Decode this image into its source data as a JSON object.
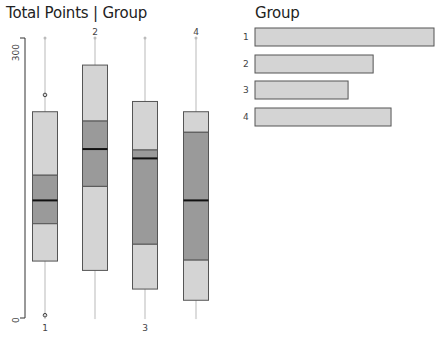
{
  "left_panel": {
    "title": "Total Points | Group"
  },
  "right_panel": {
    "title": "Group"
  },
  "colors": {
    "box_light": "#d4d4d4",
    "box_dark": "#9a9a9a",
    "box_border": "#555555",
    "whisker": "#d0d0d0",
    "median": "#111111",
    "bar_fill": "#d4d4d4",
    "bar_border": "#555555"
  },
  "chart_data": [
    {
      "type": "box",
      "title": "Total Points | Group",
      "xlabel": "Group",
      "ylabel": "Total Points",
      "ylim": [
        0,
        300
      ],
      "yticks": [
        "0",
        "300"
      ],
      "categories": [
        "1",
        "2",
        "3",
        "4"
      ],
      "category_label_positions": [
        "bottom",
        "top",
        "bottom",
        "top"
      ],
      "series": [
        {
          "group": "1",
          "whisker_low": 0,
          "q1_lower": 61,
          "q1": 101,
          "median": 126,
          "q3": 153,
          "upper_box": 221,
          "whisker_high": 300,
          "outliers": [
            3,
            239
          ]
        },
        {
          "group": "2",
          "whisker_low": 0,
          "q1_lower": 51,
          "q1": 141,
          "median": 181,
          "q3": 211,
          "upper_box": 271,
          "whisker_high": 300,
          "outliers": []
        },
        {
          "group": "3",
          "whisker_low": 0,
          "q1_lower": 31,
          "q1": 79,
          "median": 171,
          "q3": 180,
          "upper_box": 232,
          "whisker_high": 300,
          "outliers": []
        },
        {
          "group": "4",
          "whisker_low": 0,
          "q1_lower": 19,
          "q1": 62,
          "median": 126,
          "q3": 199,
          "upper_box": 221,
          "whisker_high": 300,
          "outliers": []
        }
      ]
    },
    {
      "type": "bar",
      "orientation": "horizontal",
      "title": "Group",
      "categories": [
        "1",
        "2",
        "3",
        "4"
      ],
      "values": [
        100,
        66,
        52,
        76
      ],
      "value_unit": "relative frequency (%) of max",
      "grid": false
    }
  ]
}
